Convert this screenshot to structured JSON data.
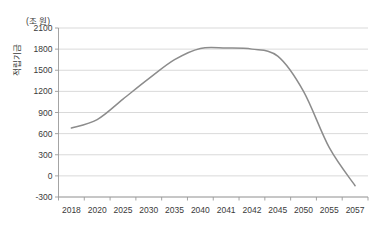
{
  "chart_data": {
    "type": "line",
    "title": "",
    "xlabel": "",
    "ylabel": "적립기금",
    "unit_label": "(조 원)",
    "categories": [
      "2018",
      "2020",
      "2025",
      "2030",
      "2035",
      "2040",
      "2041",
      "2042",
      "2045",
      "2050",
      "2055",
      "2057"
    ],
    "values": [
      680,
      800,
      1090,
      1380,
      1650,
      1810,
      1815,
      1800,
      1700,
      1200,
      400,
      -140
    ],
    "series": [
      {
        "name": "적립기금",
        "color": "#8c8c8c",
        "values": [
          680,
          800,
          1090,
          1380,
          1650,
          1810,
          1815,
          1800,
          1700,
          1200,
          400,
          -140
        ]
      }
    ],
    "yticks": [
      2100,
      1800,
      1500,
      1200,
      900,
      600,
      300,
      0,
      -300
    ],
    "ytick_labels": [
      "2100",
      "1800",
      "1500",
      "1200",
      "900",
      "600",
      "300",
      "0",
      "-300"
    ],
    "ylim": [
      -300,
      2100
    ],
    "grid": true,
    "legend": "none",
    "line_color": "#8c8c8c",
    "grid_color": "#c9c9c9",
    "axis_color": "#9a9a9a"
  }
}
